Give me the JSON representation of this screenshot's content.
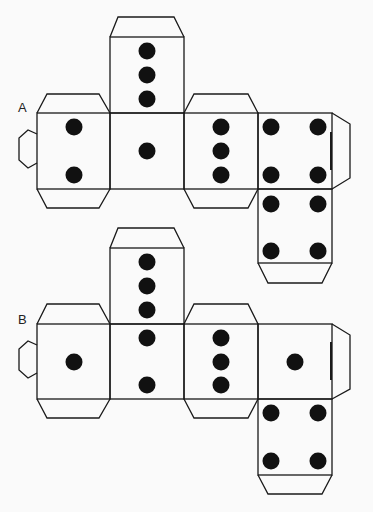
{
  "nets": [
    {
      "label": "A",
      "faces": {
        "left": 2,
        "center": 1,
        "top": 3,
        "right": 3,
        "far_right": 4,
        "bottom": 4
      }
    },
    {
      "label": "B",
      "faces": {
        "left": 1,
        "center": "2 (extends from 3 above)",
        "top": 3,
        "right": 3,
        "far_right": 1,
        "bottom": 4
      }
    }
  ],
  "colors": {
    "line": "#1a1a1a",
    "pip": "#111111",
    "background": "#fafafa"
  }
}
